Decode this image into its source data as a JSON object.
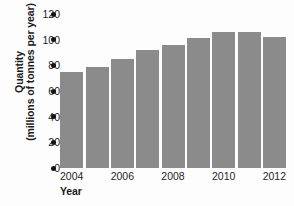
{
  "chart_data": {
    "type": "bar",
    "title": "",
    "subtitle": "",
    "xlabel": "Year",
    "ylabel_line1": "Quantity",
    "ylabel_line2": "(millions of tonnes per year)",
    "categories": [
      "2004",
      "2005",
      "2006",
      "2007",
      "2008",
      "2009",
      "2010",
      "2011",
      "2012"
    ],
    "values": [
      75,
      79,
      85,
      92,
      96,
      101,
      106,
      106,
      102
    ],
    "xtick_labels": [
      "2004",
      "2006",
      "2008",
      "2010",
      "2012"
    ],
    "xtick_categories": [
      "2004",
      "2006",
      "2008",
      "2010",
      "2012"
    ],
    "ytick_labels": [
      "0",
      "20",
      "40",
      "60",
      "80",
      "100",
      "120"
    ],
    "ytick_values": [
      0,
      20,
      40,
      60,
      80,
      100,
      120
    ],
    "ylim": [
      0,
      120
    ],
    "grid": false,
    "legend": "none",
    "bar_color": "#8b8b8b",
    "axis_color": "#141414",
    "background_color": "#fdfdfd"
  }
}
